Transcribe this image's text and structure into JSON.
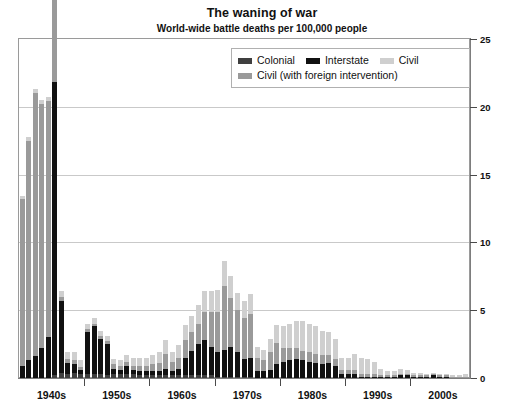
{
  "chart_data": {
    "type": "bar",
    "stacked": true,
    "title": "The waning of war",
    "subtitle": "World-wide battle deaths per 100,000 people",
    "xlabel": "",
    "ylabel": "",
    "ylim": [
      0,
      25
    ],
    "yticks": [
      0,
      5,
      10,
      15,
      20,
      25
    ],
    "y_axis_position": "right",
    "grid": true,
    "legend_position": "top-right-inside",
    "x_tick_labels": [
      "1940s",
      "1950s",
      "1960s",
      "1970s",
      "1980s",
      "1990s",
      "2000s"
    ],
    "x_start_year": 1940,
    "x_end_year": 2008,
    "colors": {
      "colonial": "#3f3f3f",
      "interstate": "#111111",
      "civil": "#cfcfcf",
      "civil_foreign": "#9a9a9a",
      "gridline": "#c9c9c9",
      "frame": "#9a9a9a",
      "axis": "#7d7d7d",
      "text": "#111111",
      "background": "#ffffff"
    },
    "legend": [
      {
        "key": "colonial",
        "label": "Colonial",
        "color": "#3f3f3f"
      },
      {
        "key": "interstate",
        "label": "Interstate",
        "color": "#111111"
      },
      {
        "key": "civil",
        "label": "Civil",
        "color": "#cfcfcf"
      },
      {
        "key": "civil_foreign",
        "label": "Civil (with foreign intervention)",
        "color": "#9a9a9a"
      }
    ],
    "series": [
      {
        "name": "Colonial",
        "key": "colonial"
      },
      {
        "name": "Interstate",
        "key": "interstate"
      },
      {
        "name": "Civil",
        "key": "civil"
      },
      {
        "name": "Civil (with foreign intervention)",
        "key": "civil_foreign"
      }
    ],
    "x": [
      1940,
      1941,
      1942,
      1943,
      1944,
      1945,
      1946,
      1947,
      1948,
      1949,
      1950,
      1951,
      1952,
      1953,
      1954,
      1955,
      1956,
      1957,
      1958,
      1959,
      1960,
      1961,
      1962,
      1963,
      1964,
      1965,
      1966,
      1967,
      1968,
      1969,
      1970,
      1971,
      1972,
      1973,
      1974,
      1975,
      1976,
      1977,
      1978,
      1979,
      1980,
      1981,
      1982,
      1983,
      1984,
      1985,
      1986,
      1987,
      1988,
      1989,
      1990,
      1991,
      1992,
      1993,
      1994,
      1995,
      1996,
      1997,
      1998,
      1999,
      2000,
      2001,
      2002,
      2003,
      2004,
      2005,
      2006,
      2007,
      2008
    ],
    "values": {
      "colonial": [
        0,
        0,
        0,
        0,
        0,
        0.2,
        0.4,
        0.3,
        0.4,
        0.3,
        0.3,
        0.3,
        0.3,
        0.2,
        0.3,
        0.3,
        0.3,
        0.3,
        0.2,
        0.2,
        0.2,
        0.2,
        0.2,
        0.2,
        0.2,
        0.2,
        0.2,
        0.2,
        0.2,
        0.2,
        0.1,
        0.1,
        0.1,
        0.1,
        0.1,
        0.1,
        0,
        0,
        0,
        0,
        0,
        0,
        0,
        0,
        0,
        0,
        0,
        0,
        0,
        0,
        0,
        0,
        0,
        0,
        0,
        0,
        0,
        0,
        0,
        0,
        0,
        0,
        0,
        0,
        0,
        0,
        0,
        0,
        0
      ],
      "interstate": [
        0.9,
        1.3,
        1.6,
        2.2,
        3.0,
        21.6,
        5.3,
        0.8,
        0.6,
        0.3,
        3.1,
        3.5,
        2.6,
        2.3,
        0.4,
        0.3,
        0.6,
        0.3,
        0.3,
        0.3,
        0.3,
        0.3,
        0.5,
        0.3,
        0.5,
        1.3,
        1.8,
        2.3,
        2.6,
        2.1,
        1.8,
        2.0,
        2.2,
        1.8,
        1.3,
        1.4,
        0.5,
        0.5,
        0.6,
        1.0,
        1.2,
        1.3,
        1.4,
        1.3,
        1.2,
        1.1,
        1.0,
        1.1,
        0.9,
        0.3,
        0.3,
        0.3,
        0.1,
        0.1,
        0.1,
        0.1,
        0.1,
        0.1,
        0.2,
        0.2,
        0.1,
        0.1,
        0.1,
        0.2,
        0.1,
        0.1,
        0,
        0,
        0
      ],
      "civil": [
        0.2,
        0.3,
        0.3,
        0.3,
        0.3,
        0.3,
        0.4,
        0.5,
        0.6,
        0.5,
        0.4,
        0.4,
        0.4,
        0.4,
        0.4,
        0.4,
        0.5,
        0.6,
        0.6,
        0.6,
        0.7,
        0.8,
        1.0,
        0.7,
        0.9,
        1.1,
        1.2,
        1.4,
        1.5,
        1.5,
        1.6,
        1.8,
        1.6,
        1.3,
        1.3,
        1.5,
        0.8,
        0.8,
        1.0,
        1.3,
        1.6,
        1.8,
        2.0,
        2.2,
        2.1,
        2.0,
        1.8,
        1.7,
        1.5,
        0.9,
        0.9,
        1.2,
        1.2,
        1.1,
        0.9,
        0.5,
        0.3,
        0.3,
        0.4,
        0.3,
        0.2,
        0.2,
        0.1,
        0.1,
        0.1,
        0.1,
        0.1,
        0.1,
        0.2
      ],
      "civil_foreign": [
        12.3,
        16.2,
        19.4,
        18.0,
        17.4,
        15.1,
        0.3,
        0.3,
        0.3,
        0.2,
        0.2,
        0.2,
        0.2,
        0.2,
        0.3,
        0.3,
        0.3,
        0.3,
        0.4,
        0.4,
        0.5,
        0.6,
        1.1,
        0.7,
        0.8,
        1.3,
        1.4,
        1.5,
        2.1,
        2.6,
        3.0,
        4.7,
        3.6,
        3.1,
        3.0,
        3.2,
        1.0,
        0.8,
        1.3,
        1.6,
        1.0,
        0.9,
        0.8,
        0.7,
        0.7,
        0.7,
        0.7,
        0.6,
        0.5,
        0.3,
        0.3,
        0.3,
        0.2,
        0.2,
        0.2,
        0.1,
        0.1,
        0.1,
        0.1,
        0.1,
        0.1,
        0.1,
        0.1,
        0.1,
        0.1,
        0.1,
        0.1,
        0.1,
        0.1
      ]
    },
    "totals_note": "Stacked: colonial + interstate + civil + civil (with foreign intervention)",
    "peaks": [
      {
        "year": 1945,
        "value": 21.6,
        "series": "Interstate"
      },
      {
        "year": 1942,
        "value": 19.4,
        "series": "Civil (with foreign intervention)"
      },
      {
        "year": 1971,
        "value": 8.6,
        "series": "stacked total"
      }
    ]
  }
}
